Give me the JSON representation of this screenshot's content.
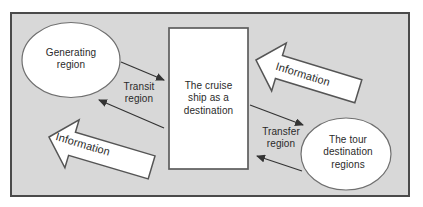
{
  "figure": {
    "nodes": {
      "generating_region": "Generating\nregion",
      "cruise_ship": "The cruise\nship as a\ndestination",
      "tour_destination_regions": "The tour\ndestination\nregions"
    },
    "flow_labels": {
      "transit_region": "Transit\nregion",
      "transfer_region": "Transfer\nregion"
    },
    "information_arrows": {
      "top": "Information",
      "bottom": "Information"
    },
    "colors": {
      "panel_background": "#d8d8d8",
      "panel_border": "#4a4a4a",
      "shape_fill": "#ffffff",
      "shape_stroke": "#6f6f6f",
      "box_stroke": "#5d5d5d",
      "arrow_line": "#333333",
      "text": "#2a2a2a"
    }
  }
}
